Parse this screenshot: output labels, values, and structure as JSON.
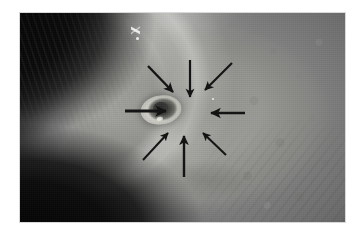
{
  "figure": {
    "kind": "clinical-photograph",
    "modality": "color photograph, grayscale reproduction",
    "caption": "",
    "background_color": "#ffffff",
    "plate": {
      "x": 20,
      "y": 13,
      "width": 325,
      "height": 209,
      "border_color": "#d8d8d8"
    },
    "tones": {
      "hair_dark": "#0a0a0a",
      "shadow_dark": "#060606",
      "skin_mid": "#9a9a96",
      "skin_light": "#d2d2cc",
      "highlight": "#f5f5f0",
      "arrow_color": "#141414"
    }
  },
  "annotations": {
    "style": "black solid arrows converging radially on the lesion",
    "count": 8,
    "target_label": "central umbilicated lesion",
    "arrows": [
      {
        "id": "arrow-n",
        "label": "arrow-pointing-down-from-top",
        "tail": [
          190,
          60
        ],
        "tip": [
          190,
          97
        ],
        "angle_deg": 90,
        "length_px": 37,
        "weight": 2.2
      },
      {
        "id": "arrow-ne",
        "label": "arrow-pointing-down-left-from-upper-right",
        "tail": [
          232,
          63
        ],
        "tip": [
          205,
          90
        ],
        "angle_deg": 135,
        "length_px": 38,
        "weight": 2.2
      },
      {
        "id": "arrow-e",
        "label": "arrow-pointing-left-from-right",
        "tail": [
          245,
          113
        ],
        "tip": [
          211,
          113
        ],
        "angle_deg": 180,
        "length_px": 34,
        "weight": 2.6
      },
      {
        "id": "arrow-se",
        "label": "arrow-pointing-up-left-from-lower-right",
        "tail": [
          226,
          155
        ],
        "tip": [
          203,
          133
        ],
        "angle_deg": 224,
        "length_px": 32,
        "weight": 2.0
      },
      {
        "id": "arrow-s",
        "label": "arrow-pointing-up-from-bottom",
        "tail": [
          184,
          177
        ],
        "tip": [
          184,
          136
        ],
        "angle_deg": 270,
        "length_px": 41,
        "weight": 2.4
      },
      {
        "id": "arrow-sw",
        "label": "arrow-pointing-up-right-from-lower-left",
        "tail": [
          143,
          160
        ],
        "tip": [
          168,
          133
        ],
        "angle_deg": 313,
        "length_px": 36,
        "weight": 2.0
      },
      {
        "id": "arrow-w",
        "label": "arrow-pointing-right-from-left",
        "tail": [
          125,
          111
        ],
        "tip": [
          166,
          111
        ],
        "angle_deg": 0,
        "length_px": 41,
        "weight": 2.8
      },
      {
        "id": "arrow-nw",
        "label": "arrow-pointing-down-right-from-upper-left",
        "tail": [
          148,
          66
        ],
        "tip": [
          173,
          92
        ],
        "angle_deg": 45,
        "length_px": 36,
        "weight": 2.4
      }
    ]
  },
  "lesion": {
    "name": "umbilicated-nodule",
    "center": [
      185,
      111
    ],
    "diameter_px": 32,
    "description": "raised pale annular rim with darker central crater"
  },
  "markers": [
    {
      "id": "mark-streak",
      "label": "light-skin-marking",
      "position": [
        132,
        24
      ]
    },
    {
      "id": "mark-dot",
      "label": "light-skin-speck",
      "position": [
        137,
        37
      ]
    },
    {
      "id": "speck-dot",
      "label": "highlight-speck",
      "position": [
        212,
        98
      ]
    }
  ]
}
